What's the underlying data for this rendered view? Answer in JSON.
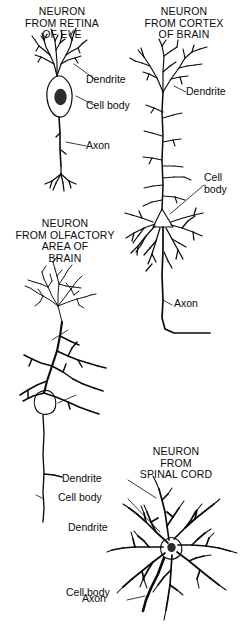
{
  "figure": {
    "background_color": "#ffffff",
    "ink_color": "#0a0a0a",
    "soma_fill_color": "#b9b9b9",
    "leader_color": "#6a6a6a"
  },
  "panels": [
    {
      "id": "retina",
      "heading": "NEURON\nFROM RETINA\nOF EYE",
      "labels": {
        "dendrite": "Dendrite",
        "cell_body": "Cell body",
        "axon": "Axon"
      }
    },
    {
      "id": "cortex",
      "heading": "NEURON\nFROM CORTEX\nOF BRAIN",
      "labels": {
        "dendrite": "Dendrite",
        "cell_body": "Cell\nbody",
        "axon": "Axon"
      }
    },
    {
      "id": "olfactory",
      "heading": "NEURON\nFROM OLFACTORY\nAREA OF\nBRAIN",
      "labels": {
        "dendrite": "Dendrite",
        "cell_body": "Cell body",
        "axon": "Axon"
      }
    },
    {
      "id": "spinal",
      "heading": "NEURON\nFROM\nSPINAL CORD",
      "labels": {
        "dendrite": "Dendrite",
        "cell_body": "Cell body",
        "axon": "Axon"
      }
    }
  ]
}
